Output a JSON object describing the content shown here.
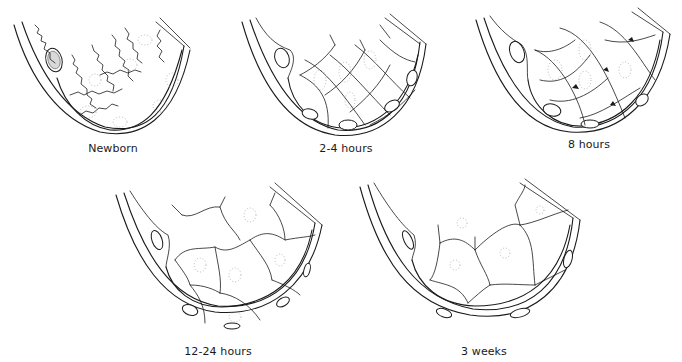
{
  "figure": {
    "panels": [
      {
        "id": "newborn",
        "label": "Newborn",
        "stage_order": 1
      },
      {
        "id": "2-4h",
        "label": "2-4 hours",
        "stage_order": 2
      },
      {
        "id": "8h",
        "label": "8 hours",
        "stage_order": 3
      },
      {
        "id": "12-24h",
        "label": "12-24 hours",
        "stage_order": 4
      },
      {
        "id": "3w",
        "label": "3 weeks",
        "stage_order": 5
      }
    ],
    "colors": {
      "line": "#1a1a1a",
      "background": "#ffffff",
      "stipple": "#9a9a9a"
    }
  }
}
